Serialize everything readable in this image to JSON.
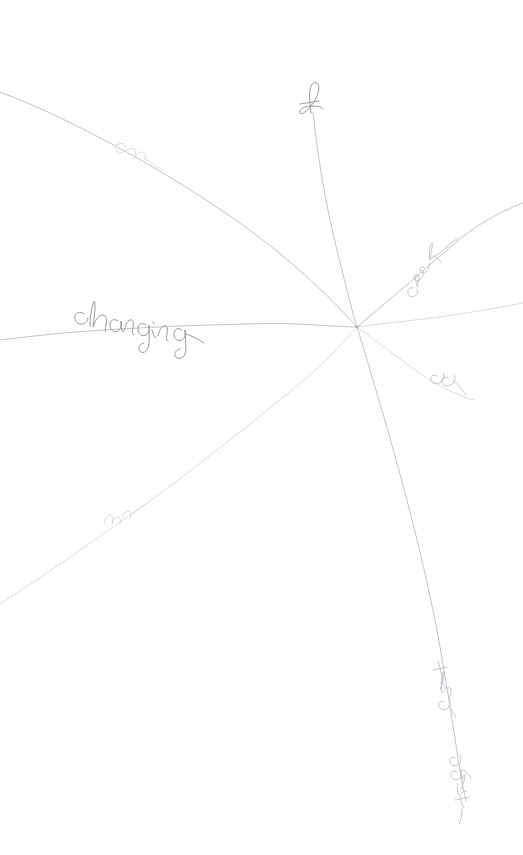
{
  "artwork": {
    "title": "radiating-lines-pencil-sketch",
    "medium": "graphite pencil on white paper",
    "background_color": "#fefefe",
    "line_color": "#b9bcc2",
    "script_color": "#8f9298",
    "width": 523,
    "height": 855
  },
  "hub": {
    "label": "convergence-point",
    "x": 357,
    "y": 327
  },
  "branches": [
    {
      "id": "branch-top",
      "direction": "up",
      "word": "of",
      "legibility": "partial",
      "word_x": 310,
      "word_y": 98,
      "start_x": 309,
      "start_y": 88,
      "end_x": 357,
      "end_y": 327
    },
    {
      "id": "branch-upper-left",
      "direction": "upper-left",
      "word": "en",
      "legibility": "faint",
      "word_x": 124,
      "word_y": 150,
      "start_x": 0,
      "start_y": 92,
      "end_x": 357,
      "end_y": 327
    },
    {
      "id": "branch-left",
      "direction": "left",
      "word": "changing",
      "legibility": "clear",
      "word_x": 78,
      "word_y": 320,
      "start_x": 0,
      "start_y": 335,
      "end_x": 357,
      "end_y": 327
    },
    {
      "id": "branch-lower-left",
      "direction": "lower-left",
      "word": "un",
      "legibility": "very-faint",
      "word_x": 112,
      "word_y": 518,
      "start_x": 0,
      "start_y": 600,
      "end_x": 357,
      "end_y": 327
    },
    {
      "id": "branch-upper-right",
      "direction": "upper-right",
      "word": "creek",
      "legibility": "clear",
      "word_x": 420,
      "word_y": 270,
      "start_x": 357,
      "start_y": 327,
      "end_x": 523,
      "end_y": 205
    },
    {
      "id": "branch-right",
      "direction": "right",
      "word": "",
      "legibility": "none",
      "word_x": 0,
      "word_y": 0,
      "start_x": 357,
      "start_y": 327,
      "end_x": 523,
      "end_y": 303
    },
    {
      "id": "branch-lower-right-short",
      "direction": "lower-right",
      "word": "ee",
      "legibility": "faint",
      "word_x": 450,
      "word_y": 380,
      "start_x": 357,
      "start_y": 327,
      "end_x": 475,
      "end_y": 400
    },
    {
      "id": "branch-bottom-right",
      "direction": "down-right",
      "words": [
        "the",
        "earth"
      ],
      "legibility": "partial",
      "word_x": 440,
      "word_y": 680,
      "start_x": 357,
      "start_y": 327,
      "end_x": 466,
      "end_y": 800
    }
  ],
  "inscriptions": [
    {
      "text": "of",
      "position": "top",
      "orientation": "vertical"
    },
    {
      "text": "en",
      "position": "upper-left",
      "orientation": "along-line"
    },
    {
      "text": "changing",
      "position": "left",
      "orientation": "horizontal"
    },
    {
      "text": "un",
      "position": "lower-left",
      "orientation": "along-line"
    },
    {
      "text": "creek",
      "position": "upper-right",
      "orientation": "along-line"
    },
    {
      "text": "ee",
      "position": "lower-right",
      "orientation": "along-line"
    },
    {
      "text": "the",
      "position": "bottom-right",
      "orientation": "vertical"
    },
    {
      "text": "earth",
      "position": "bottom",
      "orientation": "vertical"
    }
  ]
}
